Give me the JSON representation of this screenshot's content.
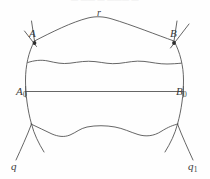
{
  "figure": {
    "kind": "geometric-diagram",
    "masthead_faint_text": "— —— — ——— —",
    "stroke_color": "#4a4a4a",
    "background_color": "#fefefe",
    "label_color": "#3a3a3a",
    "labels": {
      "point_A": "A",
      "point_B": "B",
      "point_A0_main": "A",
      "point_A0_sub": "0",
      "point_B0_main": "B",
      "point_B0_sub": "0",
      "curve_r": "r",
      "curve_q": "q",
      "curve_q1_main": "q",
      "curve_q1_sub": "1"
    },
    "elements": [
      "left-arc-q",
      "right-arc-q1",
      "top-curve-r",
      "upper-wavy-curve",
      "straight-segment-A0-B0",
      "lower-wavy-curve",
      "point-marker-A",
      "point-marker-B",
      "tick-at-A",
      "tick-at-B"
    ]
  }
}
